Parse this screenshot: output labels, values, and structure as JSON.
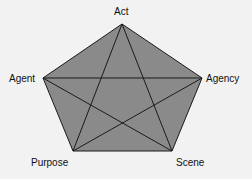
{
  "diagram": {
    "title": "",
    "type": "pentagram",
    "fill_color": "#8a8a8a",
    "line_color": "#1a1a1a",
    "nodes": [
      {
        "id": "act",
        "label": "Act",
        "x": 122,
        "y": 24
      },
      {
        "id": "agency",
        "label": "Agency",
        "x": 202,
        "y": 78
      },
      {
        "id": "scene",
        "label": "Scene",
        "x": 172,
        "y": 151
      },
      {
        "id": "purpose",
        "label": "Purpose",
        "x": 73,
        "y": 151
      },
      {
        "id": "agent",
        "label": "Agent",
        "x": 43,
        "y": 78
      }
    ],
    "edges": [
      [
        "act",
        "agency"
      ],
      [
        "agency",
        "scene"
      ],
      [
        "scene",
        "purpose"
      ],
      [
        "purpose",
        "agent"
      ],
      [
        "agent",
        "act"
      ],
      [
        "act",
        "scene"
      ],
      [
        "act",
        "purpose"
      ],
      [
        "agent",
        "agency"
      ],
      [
        "agent",
        "scene"
      ],
      [
        "agency",
        "purpose"
      ]
    ]
  }
}
